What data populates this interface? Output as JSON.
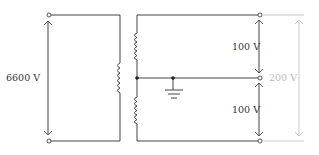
{
  "diagram": {
    "type": "single-phase three-wire transformer circuit",
    "primary": {
      "voltage_label": "6600 V"
    },
    "secondary": {
      "upper_voltage_label": "100 V",
      "lower_voltage_label": "100 V",
      "total_voltage_label": "200 V"
    },
    "colors": {
      "line": "#444444",
      "dimension_gray": "#c8c8c8",
      "text": "#333333",
      "text_gray": "#bbbbbb"
    }
  }
}
